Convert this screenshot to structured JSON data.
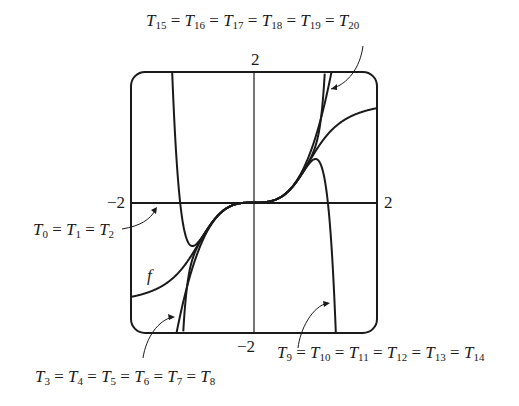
{
  "figure": {
    "function_label": "f",
    "function_formula": "arctan(x^3)",
    "window": {
      "xmin": -2,
      "xmax": 2,
      "ymin": -2,
      "ymax": 2
    },
    "tick_labels": {
      "x_left": "−2",
      "x_right": "2",
      "y_top": "2",
      "y_bottom": "−2"
    },
    "annotations": [
      {
        "id": "t0_t2",
        "base": "T",
        "indices": [
          "0",
          "1",
          "2"
        ],
        "text": "T0 = T1 = T2"
      },
      {
        "id": "t3_t8",
        "base": "T",
        "indices": [
          "3",
          "4",
          "5",
          "6",
          "7",
          "8"
        ],
        "text": "T3 = T4 = T5 = T6 = T7 = T8"
      },
      {
        "id": "t9_t14",
        "base": "T",
        "indices": [
          "9",
          "10",
          "11",
          "12",
          "13",
          "14"
        ],
        "text": "T9 = T10 = T11 = T12 = T13 = T14"
      },
      {
        "id": "t15_t20",
        "base": "T",
        "indices": [
          "15",
          "16",
          "17",
          "18",
          "19",
          "20"
        ],
        "text": "T15 = T16 = T17 = T18 = T19 = T20"
      }
    ],
    "curves": [
      {
        "name": "f",
        "expr": "arctan(x^3)"
      },
      {
        "name": "T0=T1=T2",
        "expr": "0"
      },
      {
        "name": "T3..T8",
        "expr": "x^3"
      },
      {
        "name": "T9..T14",
        "expr": "x^3 - x^9/3"
      },
      {
        "name": "T15..T20",
        "expr": "x^3 - x^9/3 + x^15/5"
      }
    ],
    "colors": {
      "stroke": "#1a1a1a",
      "background": "#ffffff"
    }
  }
}
